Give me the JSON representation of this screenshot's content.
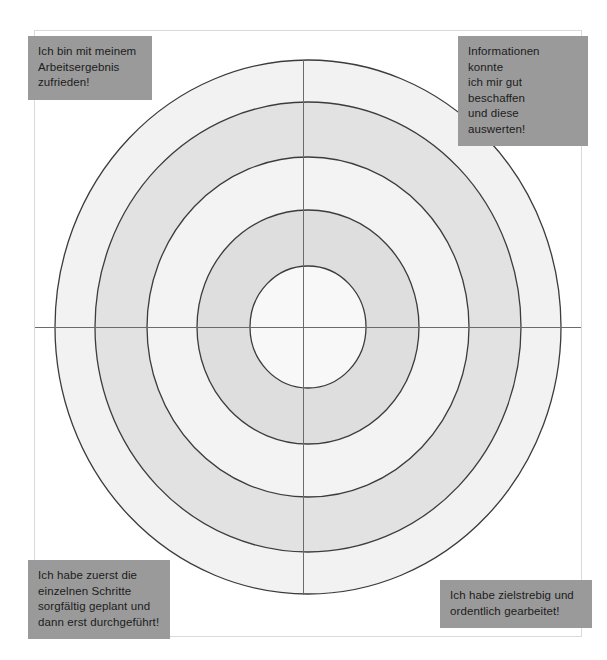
{
  "page": {
    "background_color": "#ffffff",
    "frame_border_color": "#d9d9d9"
  },
  "diagram": {
    "type": "concentric-target",
    "title": "",
    "center": {
      "x": 308,
      "y": 327
    },
    "crosshair": {
      "horizontal": true,
      "vertical": true,
      "line_color": "#6b6b6b"
    },
    "rings": [
      {
        "index": 1,
        "rx": 253,
        "ry": 267,
        "fill": "#f2f2f2",
        "stroke": "#3c3c3c"
      },
      {
        "index": 2,
        "rx": 213,
        "ry": 225,
        "fill": "#e0e0e0",
        "stroke": "#3c3c3c"
      },
      {
        "index": 3,
        "rx": 161,
        "ry": 170,
        "fill": "#f2f2f2",
        "stroke": "#3c3c3c"
      },
      {
        "index": 4,
        "rx": 111,
        "ry": 117,
        "fill": "#dedede",
        "stroke": "#3c3c3c"
      },
      {
        "index": 5,
        "rx": 58,
        "ry": 61,
        "fill": "#f7f7f7",
        "stroke": "#3c3c3c"
      }
    ]
  },
  "labels": {
    "box_color": "#9a9a9a",
    "text_color": "#1c1c1c",
    "top_left": "Ich bin mit meinem\nArbeitsergebnis\nzufrieden!",
    "top_right": "Informationen konnte\nich mir gut beschaffen\nund diese auswerten!",
    "bottom_left": "Ich habe zuerst die\neinzelnen Schritte\nsorgfältig geplant und\ndann erst durchgeführt!",
    "bottom_right": "Ich habe zielstrebig und\nordentlich gearbeitet!"
  }
}
